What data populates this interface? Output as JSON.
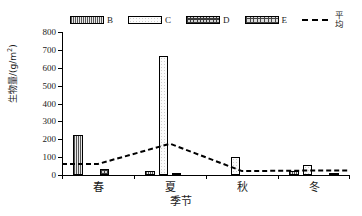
{
  "chart_data": {
    "type": "bar",
    "title": "",
    "xlabel": "季节",
    "ylabel": "生物量/(g/m²)",
    "ylabel_main": "生物量/(g/m",
    "ylabel_sup": "2",
    "ylabel_tail": ")",
    "categories": [
      "春",
      "夏",
      "秋",
      "冬"
    ],
    "ylim": [
      0,
      800
    ],
    "ytick_values": [
      0,
      100,
      200,
      300,
      400,
      500,
      600,
      700,
      800
    ],
    "ytick_labels": [
      "0",
      "100",
      "200",
      "300",
      "400",
      "500",
      "600",
      "700",
      "800"
    ],
    "grid": false,
    "legend_position": "top",
    "series": [
      {
        "name": "B",
        "pattern": "dense-vertical-hatch",
        "values": [
          222,
          20,
          0,
          25
        ]
      },
      {
        "name": "C",
        "pattern": "light-dotted",
        "values": [
          0,
          665,
          100,
          58
        ]
      },
      {
        "name": "D",
        "pattern": "dark-checkered",
        "values": [
          35,
          12,
          0,
          0
        ]
      },
      {
        "name": "E",
        "pattern": "checkered",
        "values": [
          0,
          0,
          0,
          8
        ]
      }
    ],
    "line_series": {
      "name": "平均",
      "style": "dashed",
      "color": "#000000",
      "values": [
        62,
        175,
        22,
        25
      ]
    }
  },
  "legend": {
    "items": [
      {
        "label": "B",
        "kind": "swatch"
      },
      {
        "label": "C",
        "kind": "swatch"
      },
      {
        "label": "D",
        "kind": "swatch"
      },
      {
        "label": "E",
        "kind": "swatch"
      },
      {
        "label": "平均",
        "kind": "dashed-line"
      }
    ]
  }
}
